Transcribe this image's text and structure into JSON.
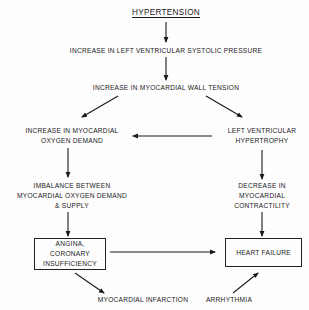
{
  "diagram": {
    "title": "HYPERTENSION",
    "nodes": {
      "systolic_pressure": "INCREASE IN LEFT VENTRICULAR SYSTOLIC PRESSURE",
      "wall_tension": "INCREASE IN MYOCARDIAL WALL TENSION",
      "oxygen_demand": [
        "INCREASE IN MYOCARDIAL",
        "OXYGEN DEMAND"
      ],
      "lv_hypertrophy": [
        "LEFT VENTRICULAR",
        "HYPERTROPHY"
      ],
      "imbalance": [
        "IMBALANCE BETWEEN",
        "MYOCARDIAL OXYGEN DEMAND",
        "& SUPPLY"
      ],
      "decrease_contractility": [
        "DECREASE IN",
        "MYOCARDIAL",
        "CONTRACTILITY"
      ],
      "angina_box": [
        "ANGINA,",
        "CORONARY",
        "INSUFFICIENCY"
      ],
      "heart_failure_box": "HEART FAILURE",
      "myocardial_infarction": "MYOCARDIAL INFARCTION",
      "arrhythmia": "ARRHYTHMIA"
    },
    "edges": [
      {
        "from": "HYPERTENSION",
        "to": "INCREASE IN LEFT VENTRICULAR SYSTOLIC PRESSURE"
      },
      {
        "from": "INCREASE IN LEFT VENTRICULAR SYSTOLIC PRESSURE",
        "to": "INCREASE IN MYOCARDIAL WALL TENSION"
      },
      {
        "from": "INCREASE IN MYOCARDIAL WALL TENSION",
        "to": "INCREASE IN MYOCARDIAL OXYGEN DEMAND"
      },
      {
        "from": "INCREASE IN MYOCARDIAL WALL TENSION",
        "to": "LEFT VENTRICULAR HYPERTROPHY"
      },
      {
        "from": "LEFT VENTRICULAR HYPERTROPHY",
        "to": "INCREASE IN MYOCARDIAL OXYGEN DEMAND"
      },
      {
        "from": "INCREASE IN MYOCARDIAL OXYGEN DEMAND",
        "to": "IMBALANCE BETWEEN MYOCARDIAL OXYGEN DEMAND & SUPPLY"
      },
      {
        "from": "LEFT VENTRICULAR HYPERTROPHY",
        "to": "DECREASE IN MYOCARDIAL CONTRACTILITY"
      },
      {
        "from": "IMBALANCE BETWEEN MYOCARDIAL OXYGEN DEMAND & SUPPLY",
        "to": "ANGINA, CORONARY INSUFFICIENCY"
      },
      {
        "from": "DECREASE IN MYOCARDIAL CONTRACTILITY",
        "to": "HEART FAILURE"
      },
      {
        "from": "ANGINA, CORONARY INSUFFICIENCY",
        "to": "HEART FAILURE"
      },
      {
        "from": "ANGINA, CORONARY INSUFFICIENCY",
        "to": "MYOCARDIAL INFARCTION"
      },
      {
        "from": "ARRHYTHMIA",
        "to": "HEART FAILURE"
      }
    ],
    "colors": {
      "ink": "#1a1a1a",
      "background": "#fdfdfd"
    }
  }
}
